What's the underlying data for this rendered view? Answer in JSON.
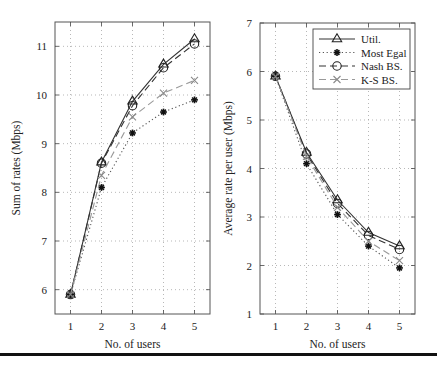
{
  "chart_data": [
    {
      "type": "line",
      "title": "",
      "xlabel": "No. of users",
      "ylabel": "Sum of rates (Mbps)",
      "x": [
        1,
        2,
        3,
        4,
        5
      ],
      "xlim": [
        0.5,
        5.5
      ],
      "ylim": [
        5.5,
        11.5
      ],
      "xticks": [
        1,
        2,
        3,
        4,
        5
      ],
      "yticks": [
        6,
        7,
        8,
        9,
        10,
        11
      ],
      "grid": true,
      "series": [
        {
          "name": "Util.",
          "values": [
            5.9,
            8.62,
            9.87,
            10.63,
            11.15
          ],
          "marker": "triangle",
          "line": "solid",
          "color": "#333333"
        },
        {
          "name": "Most Egal",
          "values": [
            5.9,
            8.1,
            9.22,
            9.65,
            9.9
          ],
          "marker": "star",
          "line": "dotted",
          "color": "#555555"
        },
        {
          "name": "Nash BS.",
          "values": [
            5.9,
            8.6,
            9.78,
            10.56,
            11.05
          ],
          "marker": "circle",
          "line": "dashed",
          "color": "#333333"
        },
        {
          "name": "K-S BS.",
          "values": [
            5.9,
            8.35,
            9.55,
            10.04,
            10.3
          ],
          "marker": "x",
          "line": "dashed",
          "color": "#999999"
        }
      ]
    },
    {
      "type": "line",
      "title": "",
      "xlabel": "No. of users",
      "ylabel": "Average rate per user (Mbps)",
      "x": [
        1,
        2,
        3,
        4,
        5
      ],
      "xlim": [
        0.5,
        5.5
      ],
      "ylim": [
        1,
        7
      ],
      "xticks": [
        1,
        2,
        3,
        4,
        5
      ],
      "yticks": [
        1,
        2,
        3,
        4,
        5,
        6,
        7
      ],
      "grid": true,
      "legend_position": "upper right",
      "series": [
        {
          "name": "Util.",
          "values": [
            5.9,
            4.33,
            3.35,
            2.68,
            2.4
          ],
          "marker": "triangle",
          "line": "solid",
          "color": "#333333"
        },
        {
          "name": "Most Egal",
          "values": [
            5.9,
            4.1,
            3.05,
            2.4,
            1.95
          ],
          "marker": "star",
          "line": "dotted",
          "color": "#555555"
        },
        {
          "name": "Nash BS.",
          "values": [
            5.9,
            4.3,
            3.28,
            2.62,
            2.33
          ],
          "marker": "circle",
          "line": "dashed",
          "color": "#333333"
        },
        {
          "name": "K-S BS.",
          "values": [
            5.9,
            4.25,
            3.2,
            2.5,
            2.1
          ],
          "marker": "x",
          "line": "dashed",
          "color": "#999999"
        }
      ]
    }
  ],
  "legend": {
    "entries": [
      "Util.",
      "Most Egal",
      "Nash BS.",
      "K-S BS."
    ]
  }
}
